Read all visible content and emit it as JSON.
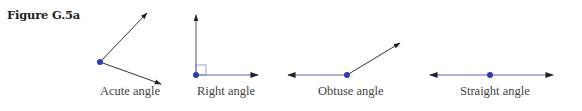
{
  "figure": {
    "title": "Figure G.5a"
  },
  "colors": {
    "vertex": "#2b3fb0",
    "ray_dark": "#333333",
    "ray_purple": "#6b5fb0",
    "right_marker": "#7a86c8",
    "label": "#444444"
  },
  "angles": [
    {
      "label": "Acute angle",
      "type": "acute"
    },
    {
      "label": "Right angle",
      "type": "right"
    },
    {
      "label": "Obtuse angle",
      "type": "obtuse"
    },
    {
      "label": "Straight angle",
      "type": "straight"
    }
  ]
}
